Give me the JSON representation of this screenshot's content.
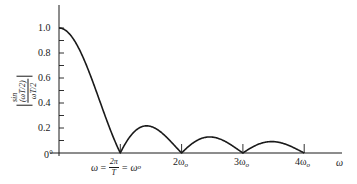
{
  "chart_data": {
    "type": "line",
    "title": "",
    "xlabel": "ω",
    "ylabel": "|sin(ωT/2) / (ωT/2)|",
    "ylabel_parts": {
      "numerator": "sin (ωT/2)",
      "denominator": "ωT/2"
    },
    "function": "|sin(π·ω/ω_o) / (π·ω/ω_o)|",
    "xlim": [
      0,
      4.5
    ],
    "ylim": [
      0,
      1.0
    ],
    "grid": false,
    "legend": "none",
    "y_ticks": [
      0,
      0.1,
      0.2,
      0.3,
      0.4,
      0.5,
      0.6,
      0.7,
      0.8,
      0.9,
      1.0
    ],
    "y_tick_labels": [
      {
        "value": 0,
        "label": "0°"
      },
      {
        "value": 0.2,
        "label": "0.2"
      },
      {
        "value": 0.4,
        "label": "0.4"
      },
      {
        "value": 0.6,
        "label": "0.6"
      },
      {
        "value": 0.8,
        "label": "0.8"
      },
      {
        "value": 1.0,
        "label": "1.0"
      }
    ],
    "x_ticks": [
      1,
      2,
      3,
      4
    ],
    "x_tick_labels": [
      {
        "value": 1,
        "label": "ω = 2π/T = ω_o"
      },
      {
        "value": 2,
        "label": "2ω_o"
      },
      {
        "value": 3,
        "label": "3ω_o"
      },
      {
        "value": 4,
        "label": "4ω_o"
      }
    ],
    "series": [
      {
        "name": "|sin(ωT/2)/(ωT/2)|",
        "x": [
          0,
          0.25,
          0.5,
          0.75,
          1.0,
          1.25,
          1.5,
          1.75,
          2.0,
          2.25,
          2.5,
          2.75,
          3.0,
          3.25,
          3.5,
          3.75,
          4.0
        ],
        "values": [
          1.0,
          0.9,
          0.64,
          0.3,
          0.0,
          0.18,
          0.21,
          0.13,
          0.0,
          0.1,
          0.13,
          0.08,
          0.0,
          0.07,
          0.09,
          0.06,
          0.0
        ]
      }
    ],
    "annotations": {
      "zero_crossings": [
        1,
        2,
        3,
        4
      ],
      "side_lobe_peaks": [
        {
          "x": 1.43,
          "y": 0.217
        },
        {
          "x": 2.46,
          "y": 0.128
        },
        {
          "x": 3.47,
          "y": 0.091
        }
      ]
    }
  },
  "labels": {
    "y_1_0": "1.0",
    "y_0_8": "0.8",
    "y_0_6": "0.6",
    "y_0_4": "0.4",
    "y_0_2": "0.2",
    "y_0": "0°",
    "x1_omega": "ω",
    "x1_eq": " = ",
    "x1_num": "2π",
    "x1_den": "T",
    "x1_eq2": " = ω",
    "x1_sub": "o",
    "x2": "2ω",
    "x3": "3ω",
    "x4": "4ω",
    "sub_o": "o",
    "x_axis_label": "ω",
    "ylab_num": "sin (ωT/2)",
    "ylab_den": "ωT/2"
  }
}
